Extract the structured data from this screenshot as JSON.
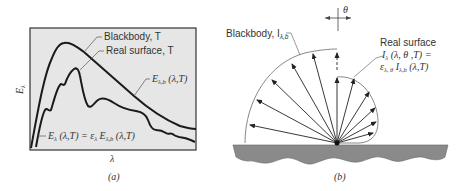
{
  "panel_a": {
    "caption": "(a)",
    "ylabel": "E",
    "ylabel_sub": "λ",
    "xlabel": "λ",
    "curve_blackbody_label": "Blackbody, T",
    "curve_real_label": "Real surface, T",
    "blackbody_eq": "E",
    "blackbody_eq_sub": "λ,b",
    "blackbody_eq_args": " (λ,T)",
    "real_eq": "E",
    "real_eq_sub": "λ",
    "real_eq_rest": " (λ,T) = ε",
    "real_eq_eps_sub": "λ",
    "real_eq_E": " E",
    "real_eq_E_sub": "λ,b",
    "real_eq_args": " (λ,T)",
    "colors": {
      "background": "#e8e8e8",
      "curve": "#1a1a1a",
      "frame": "#333333"
    }
  },
  "panel_b": {
    "caption": "(b)",
    "theta_label": "θ",
    "blackbody_label": "Blackbody, I",
    "blackbody_label_sub": "λ,b",
    "real_label_line1": "Real surface",
    "real_label_line2": "I",
    "real_label_line2_sub": "λ",
    "real_label_line2_rest": " (λ, θ ,T) =",
    "real_label_line3": "ε",
    "real_label_line3_sub": "λ, θ",
    "real_label_line3_I": " I",
    "real_label_line3_I_sub": "λ,b",
    "real_label_line3_rest": " (λ,T)",
    "colors": {
      "surface": "#8a8a8a",
      "arc": "#888888",
      "arrow": "#222222"
    }
  }
}
